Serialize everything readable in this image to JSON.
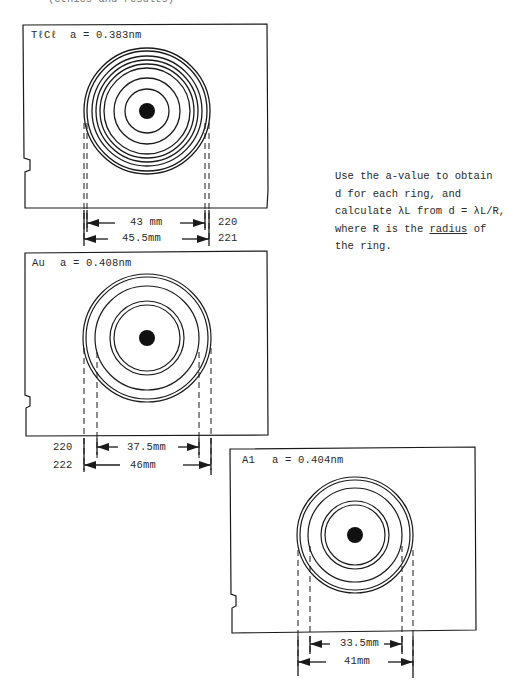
{
  "page": {
    "cut_off_top_text": "(ethics   and   results)",
    "note": {
      "lines": [
        "Use the a-value to obtain",
        "d for each ring, and",
        "calculate λL from d = λL/R,",
        [
          "where R is the ",
          "radius",
          " of"
        ],
        "the ring."
      ],
      "line1": "Use the a-value to obtain",
      "line2": "d for each ring, and",
      "line3": "calculate λL from d = λL/R,",
      "line4_pre": "where R is the ",
      "line4_underlined": "radius",
      "line4_post": " of",
      "line5": "the ring."
    }
  },
  "panels": [
    {
      "id": "tlcl",
      "material": "TℓCℓ",
      "lattice": "a = 0.383nm",
      "ring_count": 8,
      "measurements": [
        {
          "label": "43 mm",
          "index": "220"
        },
        {
          "label": "45.5mm",
          "index": "221"
        }
      ]
    },
    {
      "id": "au",
      "material": "Au",
      "lattice": "a = 0.408nm",
      "ring_count": 6,
      "measurements": [
        {
          "label": "37.5mm",
          "index": "220"
        },
        {
          "label": "46mm",
          "index": "222"
        }
      ]
    },
    {
      "id": "al",
      "material": "A1",
      "lattice": "a = 0.404nm",
      "ring_count": 6,
      "measurements": [
        {
          "label": "33.5mm"
        },
        {
          "label": "41mm"
        }
      ]
    }
  ],
  "colors": {
    "ink": "#1a1a1a",
    "paper": "#ffffff"
  }
}
